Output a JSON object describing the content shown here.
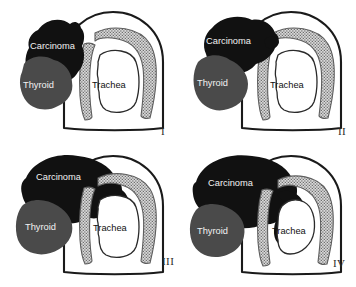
{
  "figure": {
    "background_color": "#ffffff"
  },
  "colors": {
    "carcinoma": "#111111",
    "thyroid": "#4a4a4a",
    "cartilage_fill": "#d7d7d7",
    "cartilage_dots": "#6e6e6e",
    "lumen": "#ffffff",
    "outline": "#1a1a1a",
    "label_on_dark": "#f2f2f2",
    "label_on_light": "#101010",
    "numeral": "#2b2b2b"
  },
  "labels": {
    "carcinoma": "Carcinoma",
    "thyroid": "Thyroid",
    "trachea": "Trachea"
  },
  "panels": [
    {
      "id": "panel-1",
      "numeral": "I",
      "stage": "I",
      "description": "Carcinoma abuts the thyroid and trachea without cartilage invasion",
      "labels": {
        "carcinoma": "Carcinoma",
        "thyroid": "Thyroid",
        "trachea": "Trachea"
      }
    },
    {
      "id": "panel-2",
      "numeral": "II",
      "stage": "II",
      "description": "Carcinoma reaches and contacts the outer perichondrium of the tracheal cartilage",
      "labels": {
        "carcinoma": "Carcinoma",
        "thyroid": "Thyroid",
        "trachea": "Trachea"
      }
    },
    {
      "id": "panel-3",
      "numeral": "III",
      "stage": "III",
      "description": "Carcinoma invades between the cartilage rings, extending deep to the cartilage",
      "labels": {
        "carcinoma": "Carcinoma",
        "thyroid": "Thyroid",
        "trachea": "Trachea"
      }
    },
    {
      "id": "panel-4",
      "numeral": "IV",
      "stage": "IV",
      "description": "Carcinoma penetrates full thickness and protrudes into the tracheal lumen",
      "labels": {
        "carcinoma": "Carcinoma",
        "thyroid": "Thyroid",
        "trachea": "Trachea"
      }
    }
  ]
}
